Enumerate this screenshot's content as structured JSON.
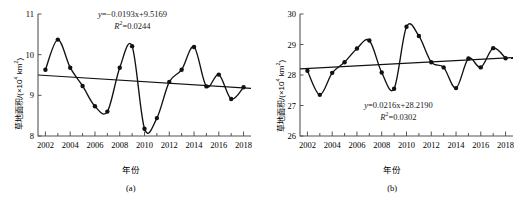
{
  "figure": {
    "panel_count": 2,
    "background": "#ffffff",
    "line_color": "#000000",
    "marker_color": "#000000"
  },
  "panel_a": {
    "caption": "(a)",
    "xlabel": "年份",
    "ylabel_main": "草地面积/(×10",
    "ylabel_exp": "4",
    "ylabel_tail": " km",
    "ylabel_exp2": "2",
    "ylabel_close": ")",
    "equation_line1_prefix": "y",
    "equation_line1": "=−0.0193x+9.5169",
    "equation_line2_prefix": "R",
    "equation_line2_exp": "2",
    "equation_line2": "=0.0244"
  },
  "panel_b": {
    "caption": "(b)",
    "xlabel": "年份",
    "ylabel_main": "草地面积/(×10",
    "ylabel_exp": "4",
    "ylabel_tail": " km",
    "ylabel_exp2": "2",
    "ylabel_close": ")",
    "equation_line1_prefix": "y",
    "equation_line1": "=0.0216x+28.2190",
    "equation_line2_prefix": "R",
    "equation_line2_exp": "2",
    "equation_line2": "=0.0302"
  },
  "chart_data": [
    {
      "id": "panel-a",
      "type": "line",
      "title": "",
      "subtitle": "(a)",
      "xlabel": "年份",
      "ylabel": "草地面积/(×10⁴ km²)",
      "xlim": [
        2001.4,
        2018.6
      ],
      "ylim": [
        8,
        11
      ],
      "yticks": [
        8,
        9,
        10,
        11
      ],
      "ytick_labels": [
        "8",
        "9",
        "10",
        "11"
      ],
      "xticks": [
        2002,
        2004,
        2006,
        2008,
        2010,
        2012,
        2014,
        2016,
        2018
      ],
      "xtick_labels": [
        "2002",
        "2004",
        "2006",
        "2008",
        "2010",
        "2012",
        "2014",
        "2016",
        "2018"
      ],
      "minor_xticks_every": 1,
      "grid": false,
      "legend": null,
      "x": [
        2002,
        2003,
        2004,
        2005,
        2006,
        2007,
        2008,
        2009,
        2010,
        2011,
        2012,
        2013,
        2014,
        2015,
        2016,
        2017,
        2018
      ],
      "series": [
        {
          "name": "草地面积",
          "style": "smooth-line-with-markers",
          "values": [
            9.63,
            10.37,
            9.68,
            9.23,
            8.73,
            8.6,
            9.68,
            10.21,
            8.18,
            8.44,
            9.33,
            9.63,
            10.19,
            9.22,
            9.51,
            8.91,
            9.2
          ]
        },
        {
          "name": "线性趋势线",
          "style": "straight-trend-line",
          "equation": "y=−0.0193x+9.5169",
          "r_squared": 0.0244,
          "endpoints": [
            [
              2001.4,
              9.5
            ],
            [
              2018.6,
              9.17
            ]
          ]
        }
      ],
      "annotations": [
        {
          "text": "y=−0.0193x+9.5169",
          "x": 2009.5,
          "y": 10.78
        },
        {
          "text": "R²=0.0244",
          "x": 2009.5,
          "y": 10.58
        }
      ]
    },
    {
      "id": "panel-b",
      "type": "line",
      "title": "",
      "subtitle": "(b)",
      "xlabel": "年份",
      "ylabel": "草地面积/(×10⁴ km²)",
      "xlim": [
        2001.4,
        2018.6
      ],
      "ylim": [
        26,
        30
      ],
      "yticks": [
        26,
        27,
        28,
        29,
        30
      ],
      "ytick_labels": [
        "26",
        "27",
        "28",
        "29",
        "30"
      ],
      "xticks": [
        2002,
        2004,
        2006,
        2008,
        2010,
        2012,
        2014,
        2016,
        2018
      ],
      "xtick_labels": [
        "2002",
        "2004",
        "2006",
        "2008",
        "2010",
        "2012",
        "2014",
        "2016",
        "2018"
      ],
      "minor_xticks_every": 1,
      "grid": false,
      "legend": null,
      "x": [
        2002,
        2003,
        2004,
        2005,
        2006,
        2007,
        2008,
        2009,
        2010,
        2011,
        2012,
        2013,
        2014,
        2015,
        2016,
        2017,
        2018
      ],
      "series": [
        {
          "name": "草地面积",
          "style": "smooth-line-with-markers",
          "values": [
            28.14,
            27.35,
            28.07,
            28.42,
            28.87,
            29.13,
            28.08,
            27.55,
            29.58,
            29.28,
            28.42,
            28.25,
            27.57,
            28.54,
            28.25,
            28.88,
            28.55
          ]
        },
        {
          "name": "线性趋势线",
          "style": "straight-trend-line",
          "equation": "y=0.0216x+28.2190",
          "r_squared": 0.0302,
          "endpoints": [
            [
              2001.4,
              28.2
            ],
            [
              2018.6,
              28.57
            ]
          ]
        }
      ],
      "annotations": [
        {
          "text": "y=0.0216x+28.2190",
          "x": 2011.0,
          "y": 26.95
        },
        {
          "text": "R²=0.0302",
          "x": 2011.0,
          "y": 26.72
        }
      ]
    }
  ]
}
